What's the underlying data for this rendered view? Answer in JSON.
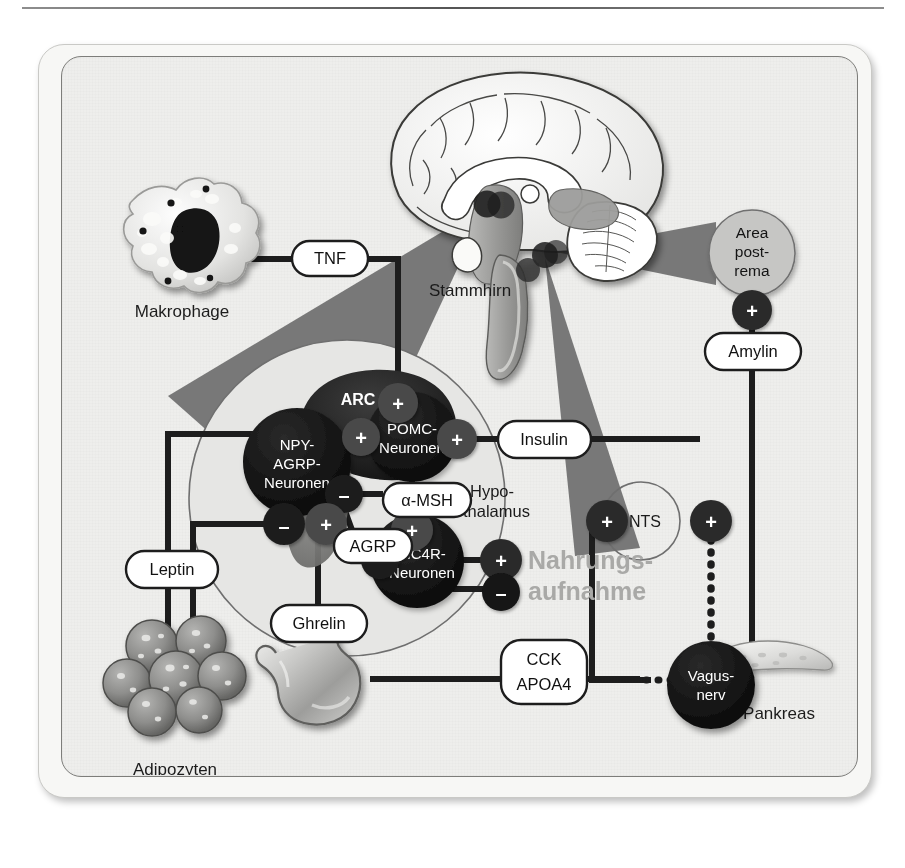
{
  "figure": {
    "language": "de",
    "background_color": "#eeeeec",
    "frame_color": "#7d7d7a",
    "accent_gray": "#6f6f6f",
    "node_dark": "#151515",
    "goal_text_color": "#a9a9a7"
  },
  "organs": {
    "makrophage": "Makrophage",
    "adipozyten": "Adipozyten",
    "magen_darm_trakt": "Magen-Darm-Trakt",
    "pankreas": "Pankreas",
    "vagusnerv_line1": "Vagus-",
    "vagusnerv_line2": "nerv"
  },
  "brain": {
    "stammhirn": "Stammhirn",
    "hypothalamus_line1": "Hypo-",
    "hypothalamus_line2": "thalamus",
    "area_postrema_line1": "Area",
    "area_postrema_line2": "post-",
    "area_postrema_line3": "rema",
    "nts": "NTS",
    "arc": "ARC"
  },
  "neurons": {
    "npy_agrp_line1": "NPY-",
    "npy_agrp_line2": "AGRP-",
    "npy_agrp_line3": "Neuronen",
    "pomc_line1": "POMC-",
    "pomc_line2": "Neuronen",
    "mc4r_line1": "MC4R-",
    "mc4r_line2": "Neuronen"
  },
  "mediators": {
    "tnf": "TNF",
    "leptin": "Leptin",
    "ghrelin": "Ghrelin",
    "insulin": "Insulin",
    "amylin": "Amylin",
    "alpha_msh": "α-MSH",
    "agrp": "AGRP",
    "cck": "CCK",
    "apoa4": "APOA4"
  },
  "outcome": {
    "line1": "Nahrungs-",
    "line2": "aufnahme"
  },
  "signs": {
    "plus": "+",
    "minus": "–"
  },
  "edges": [
    {
      "id": "makrophage-tnf-arc",
      "from": "Makrophage",
      "to": "POMC-Neuronen",
      "mediator": "TNF",
      "sign": "+"
    },
    {
      "id": "adipozyten-leptin-npy",
      "from": "Adipozyten",
      "to": "NPY-AGRP-Neuronen",
      "mediator": "Leptin",
      "sign": "–"
    },
    {
      "id": "adipozyten-leptin-pomc",
      "from": "Adipozyten",
      "to": "POMC-Neuronen",
      "mediator": "Leptin",
      "sign": "+"
    },
    {
      "id": "magen-ghrelin-npy",
      "from": "Magen-Darm-Trakt",
      "to": "NPY-AGRP-Neuronen",
      "mediator": "Ghrelin",
      "sign": "+"
    },
    {
      "id": "pankreas-insulin-pomc",
      "from": "Pankreas",
      "to": "POMC-Neuronen",
      "mediator": "Insulin",
      "sign": "+"
    },
    {
      "id": "pankreas-amylin-ap",
      "from": "Pankreas",
      "to": "Area postrema",
      "mediator": "Amylin",
      "sign": "+"
    },
    {
      "id": "pomc-amsh-mc4r",
      "from": "POMC-Neuronen",
      "to": "MC4R-Neuronen",
      "mediator": "α-MSH",
      "sign": "+"
    },
    {
      "id": "npy-agrp-mc4r",
      "from": "NPY-AGRP-Neuronen",
      "to": "MC4R-Neuronen",
      "mediator": "AGRP",
      "sign": "–"
    },
    {
      "id": "npy-inhibits-pomc",
      "from": "NPY-AGRP-Neuronen",
      "to": "POMC-Neuronen",
      "mediator": "",
      "sign": "–"
    },
    {
      "id": "mc4r-nahrungsaufnahme-plus",
      "from": "MC4R-Neuronen",
      "to": "Nahrungsaufnahme",
      "mediator": "",
      "sign": "+"
    },
    {
      "id": "mc4r-nahrungsaufnahme-minus",
      "from": "MC4R-Neuronen",
      "to": "Nahrungsaufnahme",
      "mediator": "",
      "sign": "–"
    },
    {
      "id": "magen-cck-vagus",
      "from": "Magen-Darm-Trakt",
      "to": "Vagusnerv",
      "mediator": "CCK / APOA4",
      "sign": ""
    },
    {
      "id": "vagus-nts",
      "from": "Vagusnerv",
      "to": "NTS",
      "mediator": "",
      "sign": "+"
    },
    {
      "id": "nts-hypothalamus",
      "from": "NTS",
      "to": "Hypothalamus",
      "mediator": "",
      "sign": "+"
    }
  ]
}
